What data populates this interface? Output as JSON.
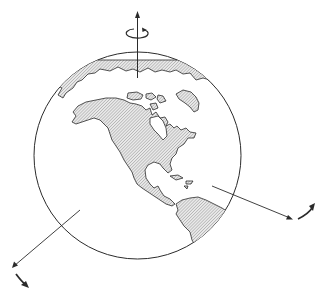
{
  "figure": {
    "colors": {
      "background": "#ffffff",
      "stroke": "#2b2b2b",
      "land_hatch": "#8a8a8a",
      "land_fill": "#e4e4e4"
    },
    "globe": {
      "cx": 137.5,
      "cy": 155.5,
      "r": 103.5
    },
    "axes": [
      {
        "name": "vertical-axis",
        "from": [
          137.5,
          78
        ],
        "to": [
          137.5,
          12
        ],
        "rotation_marker": "circular-arrow"
      },
      {
        "name": "right-axis",
        "from": [
          212,
          186
        ],
        "to": [
          292,
          219
        ],
        "rotation_marker": "curved-arrow"
      },
      {
        "name": "left-axis",
        "from": [
          80,
          210
        ],
        "to": [
          12,
          268
        ],
        "rotation_marker": "curved-arrow"
      }
    ],
    "regions": [
      "Arctic",
      "Greenland",
      "North America",
      "Central America",
      "Caribbean",
      "South America"
    ]
  }
}
